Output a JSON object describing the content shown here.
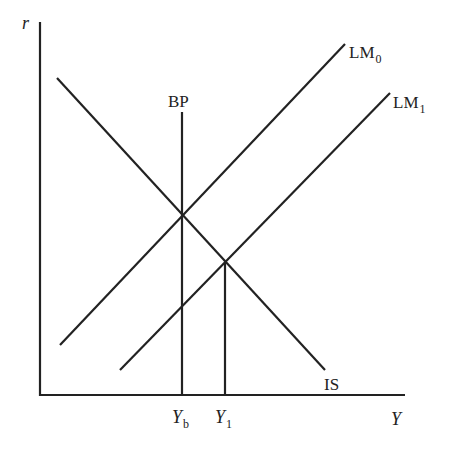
{
  "diagram": {
    "axes": {
      "y_label": "r",
      "x_label": "Y",
      "origin": [
        40,
        395
      ],
      "y_top": 22,
      "x_right": 405
    },
    "curves": [
      {
        "name": "IS",
        "label": "IS",
        "from": [
          57,
          78
        ],
        "to": [
          325,
          370
        ]
      },
      {
        "name": "LM0",
        "label": "LM",
        "label_sub": "0",
        "from": [
          60,
          345
        ],
        "to": [
          345,
          44
        ]
      },
      {
        "name": "LM1",
        "label": "LM",
        "label_sub": "1",
        "from": [
          120,
          370
        ],
        "to": [
          390,
          93
        ]
      },
      {
        "name": "BP",
        "label": "BP",
        "from": [
          182,
          112
        ],
        "to": [
          182,
          395
        ]
      }
    ],
    "drop_lines": [
      {
        "name": "Y1-line",
        "from": [
          225,
          263
        ],
        "to": [
          225,
          395
        ]
      }
    ],
    "x_ticks": [
      {
        "label": "Y",
        "sub": "b",
        "x": 182
      },
      {
        "label": "Y",
        "sub": "1",
        "x": 225
      }
    ],
    "stroke_color": "#222222"
  }
}
